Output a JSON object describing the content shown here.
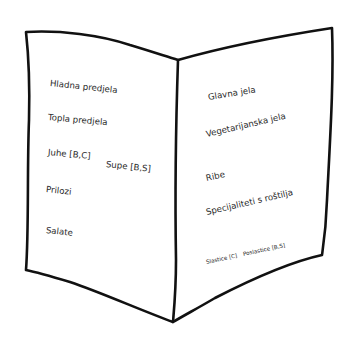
{
  "diagram": {
    "type": "hand-drawn open menu booklet sketch",
    "stroke_color": "#111111",
    "left_page": {
      "items": [
        {
          "label": "Hladna predjela"
        },
        {
          "label": "Topla predjela"
        },
        {
          "label": "Juhe [B,C]"
        },
        {
          "label": "Supe [B,S]"
        },
        {
          "label": "Prilozi"
        },
        {
          "label": "Salate"
        }
      ]
    },
    "right_page": {
      "items": [
        {
          "label": "Glavna jela"
        },
        {
          "label": "Vegetarijanska jela"
        },
        {
          "label": "Ribe"
        },
        {
          "label": "Specijaliteti s roštilja"
        },
        {
          "label": "Slastice [C]"
        },
        {
          "label": "Poslastice [B,S]"
        }
      ]
    }
  }
}
